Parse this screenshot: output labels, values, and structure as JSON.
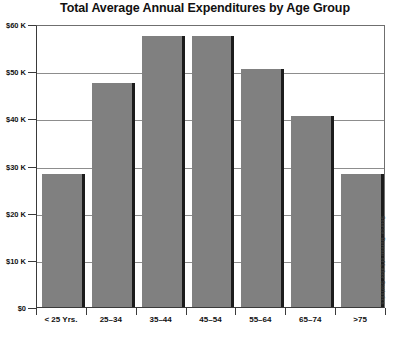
{
  "chart_data": {
    "type": "bar",
    "title": "Total Average Annual Expenditures by Age Group",
    "xlabel": "",
    "ylabel": "",
    "categories": [
      "< 25 Yrs.",
      "25–34",
      "35–44",
      "45–54",
      "55–64",
      "65–74",
      ">75"
    ],
    "values": [
      28200,
      47400,
      57500,
      57500,
      50400,
      40500,
      28200
    ],
    "value_labels": [
      "$28.2 K",
      "$47.4 K",
      "$57.5 K",
      "$57.5 K",
      "$50.4 K",
      "$40.5 K",
      "$28.2 K"
    ],
    "ylim": [
      0,
      60000
    ],
    "yticks": [
      0,
      10000,
      20000,
      30000,
      40000,
      50000,
      60000
    ],
    "ytick_labels": [
      "$0",
      "$10 K",
      "$20 K",
      "$30 K",
      "$40 K",
      "$50 K",
      "$60 K"
    ],
    "grid": true,
    "legend": false,
    "bar_color": "#808080",
    "bar_shadow_color": "#1c1c1c",
    "axis_color": "#3a3a3a",
    "gridline_color": "#8d8d8d",
    "annotation": "Source: Bureau of Labor Statistics"
  },
  "caption_fragment": ""
}
